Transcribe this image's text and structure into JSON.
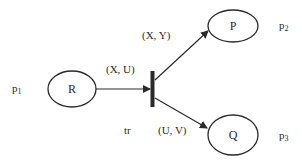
{
  "diagram": {
    "type": "petri-net",
    "places": [
      {
        "id": "p1",
        "token_label": "R",
        "place_label": "p",
        "place_sub": "1"
      },
      {
        "id": "p2",
        "token_label": "P",
        "place_label": "p",
        "place_sub": "2"
      },
      {
        "id": "p3",
        "token_label": "Q",
        "place_label": "p",
        "place_sub": "3"
      }
    ],
    "transition": {
      "label": "tr"
    },
    "arcs": [
      {
        "from": "p1",
        "to": "tr",
        "label": "(X, U)"
      },
      {
        "from": "tr",
        "to": "p2",
        "label": "(X, Y)"
      },
      {
        "from": "tr",
        "to": "p3",
        "label": "(U, V)"
      }
    ],
    "colors": {
      "stroke": "#2a2a2a",
      "background": "#ffffff"
    }
  }
}
